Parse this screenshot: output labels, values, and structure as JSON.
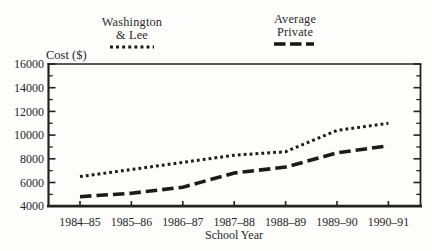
{
  "figure": {
    "background": "#fdfdfb",
    "ink_color": "#1b1b1b"
  },
  "chart_data": {
    "type": "line",
    "title": "",
    "xlabel": "School Year",
    "ylabel": "Cost ($)",
    "categories": [
      "1984–85",
      "1985–86",
      "1986–87",
      "1987–88",
      "1988–89",
      "1989–90",
      "1990–91"
    ],
    "series": [
      {
        "name": "Washington & Lee",
        "legend_lines": [
          "Washington",
          "& Lee"
        ],
        "line_style": "dotted",
        "values": [
          6500,
          7100,
          7700,
          8300,
          8600,
          10400,
          11000
        ]
      },
      {
        "name": "Average Private",
        "legend_lines": [
          "Average",
          "Private"
        ],
        "line_style": "dashed",
        "values": [
          4800,
          5100,
          5600,
          6800,
          7300,
          8500,
          9100
        ]
      }
    ],
    "ylim": [
      4000,
      16000
    ],
    "yticks": [
      4000,
      6000,
      8000,
      10000,
      12000,
      14000,
      16000
    ],
    "minor_tick_step": 1000,
    "grid": false,
    "legend_position": "top",
    "line_color": "#1b1b1b"
  }
}
